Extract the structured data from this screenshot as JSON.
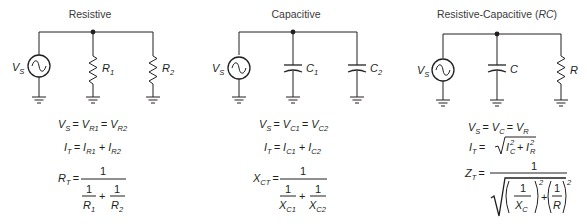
{
  "panels": [
    {
      "title": "Resistive",
      "source_label": "V",
      "source_sub": "S",
      "components": [
        {
          "type": "resistor",
          "label": "R",
          "sub": "1"
        },
        {
          "type": "resistor",
          "label": "R",
          "sub": "2"
        }
      ],
      "equations": {
        "voltage": {
          "lhs": "V",
          "lhs_sub": "S",
          "t1": "V",
          "t1_sub": "R1",
          "t2": "V",
          "t2_sub": "R2"
        },
        "current": {
          "lhs": "I",
          "lhs_sub": "T",
          "t1": "I",
          "t1_sub": "R1",
          "t2": "I",
          "t2_sub": "R2"
        },
        "total": {
          "lhs": "R",
          "lhs_sub": "T",
          "num": "1",
          "d1_num": "1",
          "d1_den": "R",
          "d1_den_sub": "1",
          "d2_num": "1",
          "d2_den": "R",
          "d2_den_sub": "2"
        }
      }
    },
    {
      "title": "Capacitive",
      "source_label": "V",
      "source_sub": "S",
      "components": [
        {
          "type": "capacitor",
          "label": "C",
          "sub": "1"
        },
        {
          "type": "capacitor",
          "label": "C",
          "sub": "2"
        }
      ],
      "equations": {
        "voltage": {
          "lhs": "V",
          "lhs_sub": "S",
          "t1": "V",
          "t1_sub": "C1",
          "t2": "V",
          "t2_sub": "C2"
        },
        "current": {
          "lhs": "I",
          "lhs_sub": "T",
          "t1": "I",
          "t1_sub": "C1",
          "t2": "I",
          "t2_sub": "C2"
        },
        "total": {
          "lhs": "X",
          "lhs_sub": "CT",
          "num": "1",
          "d1_num": "1",
          "d1_den": "X",
          "d1_den_sub": "C1",
          "d2_num": "1",
          "d2_den": "X",
          "d2_den_sub": "C2"
        }
      }
    },
    {
      "title": "Resistive-Capacitive (",
      "title_italic": "RC",
      "title_end": ")",
      "source_label": "V",
      "source_sub": "S",
      "components": [
        {
          "type": "capacitor",
          "label": "C",
          "sub": ""
        },
        {
          "type": "resistor",
          "label": "R",
          "sub": ""
        }
      ],
      "equations": {
        "voltage": {
          "lhs": "V",
          "lhs_sub": "S",
          "t1": "V",
          "t1_sub": "C",
          "t2": "V",
          "t2_sub": "R"
        },
        "current": {
          "lhs": "I",
          "lhs_sub": "T",
          "t1": "I",
          "t1_sub": "C",
          "t1_sup": "2",
          "t2": "I",
          "t2_sub": "R",
          "t2_sup": "2"
        },
        "total": {
          "lhs": "Z",
          "lhs_sub": "T",
          "num": "1",
          "d1_num": "1",
          "d1_den": "X",
          "d1_den_sub": "C",
          "d2_num": "1",
          "d2_den": "R",
          "exp": "2"
        }
      }
    }
  ],
  "symbols": {
    "equals": "=",
    "plus": "+"
  }
}
